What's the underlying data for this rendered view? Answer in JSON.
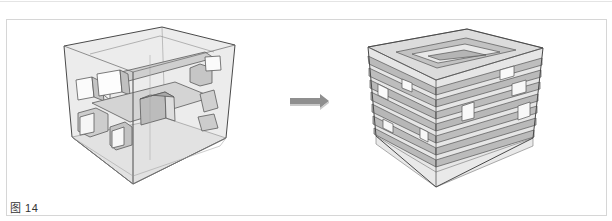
{
  "figure": {
    "caption": "图 14",
    "left_model": {
      "description": "transparent cube with intersecting rectangular tube volumes"
    },
    "arrow": {
      "icon": "right-arrow-icon",
      "color": "#8f8f8f"
    },
    "right_model": {
      "description": "cube composed of stacked horizontal bands with voids"
    },
    "colors": {
      "line": "#555555",
      "glass": "#e9e9e9",
      "face_shade": "#bdbdbd",
      "band": "#b9b9b9",
      "band_light": "#dcdcdc"
    }
  }
}
